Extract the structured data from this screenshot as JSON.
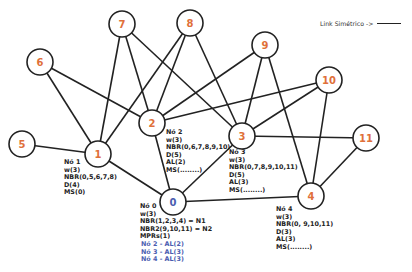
{
  "legend": {
    "label": "Link Simétrico ->",
    "line_style": "solid"
  },
  "colors": {
    "node_label_default": "#e0703a",
    "node_label_root": "#4a5db0",
    "edge": "#222222",
    "mpr_text": "#4a5db0"
  },
  "nodes": [
    {
      "id": "0",
      "x": 173,
      "y": 202,
      "r": 13,
      "color": "#4a5db0"
    },
    {
      "id": "1",
      "x": 98,
      "y": 154,
      "r": 13,
      "color": "#e0703a"
    },
    {
      "id": "2",
      "x": 152,
      "y": 123,
      "r": 13,
      "color": "#e0703a"
    },
    {
      "id": "3",
      "x": 242,
      "y": 136,
      "r": 13,
      "color": "#e0703a"
    },
    {
      "id": "4",
      "x": 311,
      "y": 196,
      "r": 13,
      "color": "#e0703a"
    },
    {
      "id": "5",
      "x": 22,
      "y": 144,
      "r": 13,
      "color": "#e0703a"
    },
    {
      "id": "6",
      "x": 40,
      "y": 62,
      "r": 13,
      "color": "#e0703a"
    },
    {
      "id": "7",
      "x": 122,
      "y": 24,
      "r": 13,
      "color": "#e0703a"
    },
    {
      "id": "8",
      "x": 190,
      "y": 23,
      "r": 13,
      "color": "#e0703a"
    },
    {
      "id": "9",
      "x": 265,
      "y": 45,
      "r": 13,
      "color": "#e0703a"
    },
    {
      "id": "10",
      "x": 329,
      "y": 80,
      "r": 13,
      "color": "#e0703a"
    },
    {
      "id": "11",
      "x": 366,
      "y": 138,
      "r": 13,
      "color": "#e0703a"
    }
  ],
  "edges": [
    [
      "1",
      "5"
    ],
    [
      "1",
      "6"
    ],
    [
      "1",
      "7"
    ],
    [
      "1",
      "8"
    ],
    [
      "1",
      "0"
    ],
    [
      "2",
      "6"
    ],
    [
      "2",
      "7"
    ],
    [
      "2",
      "8"
    ],
    [
      "2",
      "9"
    ],
    [
      "2",
      "10"
    ],
    [
      "2",
      "0"
    ],
    [
      "3",
      "7"
    ],
    [
      "3",
      "8"
    ],
    [
      "3",
      "9"
    ],
    [
      "3",
      "10"
    ],
    [
      "3",
      "11"
    ],
    [
      "3",
      "0"
    ],
    [
      "4",
      "9"
    ],
    [
      "4",
      "10"
    ],
    [
      "4",
      "11"
    ],
    [
      "4",
      "0"
    ]
  ],
  "node_info": {
    "n1": {
      "title": "Nó 1",
      "lines": [
        "w(3)",
        "NBR(0,5,6,7,8)",
        "D(4)",
        "MS(0)"
      ]
    },
    "n2": {
      "title": "Nó 2",
      "lines": [
        "w(3)",
        "NBR(0,6,7,8,9,10)",
        "D(5)",
        "AL(2)",
        "MS(........)"
      ]
    },
    "n3": {
      "title": "Nó 3",
      "lines": [
        "w(3)",
        "NBR(0,7,8,9,10,11)",
        "D(5)",
        "AL(3)",
        "MS(........)"
      ]
    },
    "n4": {
      "title": "Nó 4",
      "lines": [
        "w(3)",
        "NBR(0, 9,10,11)",
        "D(3)",
        "AL(3)",
        "MS(........)"
      ]
    },
    "n0": {
      "title": "Nó 0",
      "lines": [
        "w(3)",
        "NBR(1,2,3,4)  = N1",
        "NBR2(9,10,11) = N2",
        "MPRs(1)"
      ],
      "mpr_lines": [
        "Nó 2 - AL(2)",
        "Nó 3 - AL(3)",
        "Nó 4 - AL(3)"
      ]
    }
  }
}
